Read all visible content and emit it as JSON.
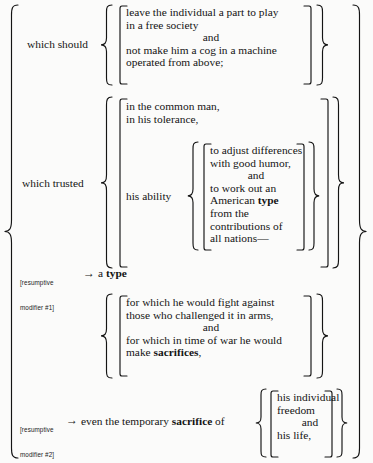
{
  "diagram": {
    "background_color": "#fbfbfa",
    "ink_color": "#141414"
  },
  "branches": {
    "which_should": {
      "label": "which should",
      "lines": [
        "leave the individual a part to play",
        "in a free society",
        "and",
        "not make him a cog in a machine",
        "operated from above;"
      ],
      "center_line_index": 2
    },
    "which_trusted": {
      "label": "which trusted",
      "lines": [
        "in the common man,",
        "in his tolerance,"
      ],
      "sub": {
        "label": "his ability",
        "lines": [
          "to adjust differences",
          "with good humor,",
          "and",
          "to work out an",
          "American type",
          "from the",
          "contributions of",
          "all nations—"
        ],
        "bold_words": [
          "type"
        ],
        "center_line_index": 2
      }
    },
    "for_which": {
      "lines": [
        "for which he would fight against",
        "those who challenged it in arms,",
        "and",
        "for which in time of war he would",
        "make sacrifices,"
      ],
      "bold_words": [
        "sacrifices"
      ],
      "center_line_index": 2
    },
    "sacrifice_of": {
      "lines": [
        "his individual",
        "freedom",
        "and",
        "his life,"
      ],
      "center_line_index": 2
    }
  },
  "resumptive_modifiers": [
    {
      "tag_line1": "[resumptive",
      "tag_line2": "modifier #1]",
      "arrow": "→",
      "text_plain": "a ",
      "text_bold": "type"
    },
    {
      "tag_line1": "[resumptive",
      "tag_line2": "modifier #2]",
      "arrow": "→",
      "text_before": "even the temporary ",
      "text_bold": "sacrifice",
      "text_after": " of"
    }
  ],
  "icons": {
    "left_outer_brace": "curly-brace-left",
    "right_outer_brace": "curly-brace-right",
    "group_brace_left": "curly-brace-left",
    "group_brace_right": "curly-brace-right",
    "square_bracket_left": "square-bracket-left",
    "square_bracket_right": "square-bracket-right",
    "arrow": "arrow-right-icon"
  }
}
